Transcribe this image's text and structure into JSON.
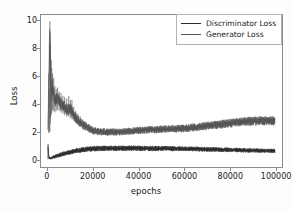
{
  "chart_data": {
    "type": "line",
    "title": "",
    "xlabel": "epochs",
    "ylabel": "Loss",
    "xlim": [
      -3000,
      103000
    ],
    "ylim": [
      -0.55,
      10.45
    ],
    "xticks": [
      0,
      20000,
      40000,
      60000,
      80000,
      100000
    ],
    "xticklabels": [
      "0",
      "20000",
      "40000",
      "60000",
      "80000",
      "100000"
    ],
    "yticks": [
      0,
      2,
      4,
      6,
      8,
      10
    ],
    "yticklabels": [
      "0",
      "2",
      "4",
      "6",
      "8",
      "10"
    ],
    "grid": false,
    "legend_position": "upper right",
    "series": [
      {
        "name": "Discriminator Loss",
        "color": "#2b2b2b",
        "x": [
          0,
          500,
          1000,
          1500,
          2000,
          3000,
          4000,
          5000,
          6000,
          8000,
          10000,
          12000,
          14000,
          16000,
          18000,
          20000,
          24000,
          28000,
          32000,
          36000,
          40000,
          45000,
          50000,
          55000,
          60000,
          65000,
          70000,
          75000,
          80000,
          85000,
          90000,
          95000,
          100000
        ],
        "values": [
          1.0,
          0.18,
          0.08,
          0.1,
          0.14,
          0.2,
          0.26,
          0.31,
          0.36,
          0.45,
          0.53,
          0.6,
          0.66,
          0.71,
          0.75,
          0.78,
          0.8,
          0.8,
          0.8,
          0.8,
          0.8,
          0.79,
          0.79,
          0.78,
          0.77,
          0.75,
          0.73,
          0.71,
          0.69,
          0.67,
          0.65,
          0.63,
          0.62
        ],
        "band": [
          0.1,
          0.16,
          0.12,
          0.14,
          0.16,
          0.18,
          0.19,
          0.2,
          0.21,
          0.22,
          0.23,
          0.24,
          0.25,
          0.25,
          0.26,
          0.26,
          0.26,
          0.26,
          0.26,
          0.26,
          0.25,
          0.25,
          0.24,
          0.24,
          0.23,
          0.23,
          0.22,
          0.22,
          0.21,
          0.21,
          0.2,
          0.2,
          0.19
        ]
      },
      {
        "name": "Generator Loss",
        "color": "#555555",
        "x": [
          0,
          400,
          800,
          1200,
          1600,
          2000,
          2600,
          3200,
          4000,
          5000,
          6000,
          7000,
          8000,
          9000,
          10000,
          11000,
          12000,
          13000,
          14000,
          16000,
          18000,
          20000,
          22000,
          25000,
          28000,
          32000,
          36000,
          40000,
          45000,
          50000,
          55000,
          60000,
          65000,
          70000,
          75000,
          80000,
          85000,
          90000,
          95000,
          100000
        ],
        "values": [
          2.0,
          5.0,
          8.6,
          6.0,
          4.6,
          5.3,
          4.8,
          4.2,
          4.45,
          4.2,
          4.0,
          3.85,
          3.7,
          3.55,
          3.7,
          3.3,
          3.05,
          2.85,
          2.7,
          2.45,
          2.25,
          2.1,
          2.02,
          1.98,
          1.98,
          2.0,
          2.05,
          2.1,
          2.15,
          2.18,
          2.2,
          2.25,
          2.32,
          2.42,
          2.52,
          2.62,
          2.72,
          2.78,
          2.8,
          2.8
        ],
        "band": [
          0.55,
          1.4,
          1.5,
          1.1,
          0.85,
          0.8,
          0.7,
          0.62,
          0.62,
          0.6,
          0.58,
          0.56,
          0.55,
          0.54,
          0.58,
          0.52,
          0.5,
          0.48,
          0.46,
          0.43,
          0.4,
          0.38,
          0.36,
          0.35,
          0.34,
          0.34,
          0.34,
          0.35,
          0.35,
          0.36,
          0.36,
          0.37,
          0.38,
          0.39,
          0.4,
          0.41,
          0.42,
          0.43,
          0.43,
          0.43
        ]
      }
    ],
    "annotations": [
      {
        "text": "peak generator loss spike",
        "x": 1200,
        "y": 10.0
      }
    ]
  },
  "legend": {
    "entries": [
      {
        "label": "Discriminator Loss",
        "color": "#2b2b2b"
      },
      {
        "label": "Generator Loss",
        "color": "#555555"
      }
    ]
  },
  "axes": {
    "xlabel": "epochs",
    "ylabel": "Loss"
  }
}
